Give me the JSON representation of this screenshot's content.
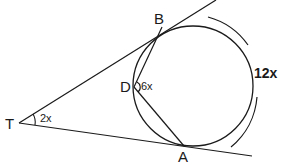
{
  "diagram": {
    "type": "geometry",
    "points": {
      "T": "T",
      "B": "B",
      "D": "D",
      "A": "A"
    },
    "angles": {
      "angle_T": "2x",
      "angle_D": "6x"
    },
    "arcs": {
      "major_arc_AB": "12x"
    },
    "colors": {
      "stroke": "#1a1a1a",
      "background": "#ffffff"
    }
  }
}
